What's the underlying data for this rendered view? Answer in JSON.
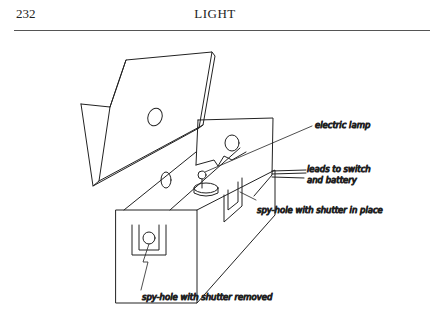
{
  "header": {
    "page_number": "232",
    "running_title": "LIGHT"
  },
  "figure": {
    "labels": {
      "lamp": "electric lamp",
      "leads_1": "leads to switch",
      "leads_2": "and battery",
      "shutter_in": "spy-hole with shutter in place",
      "shutter_out": "spy-hole with shutter removed"
    }
  }
}
